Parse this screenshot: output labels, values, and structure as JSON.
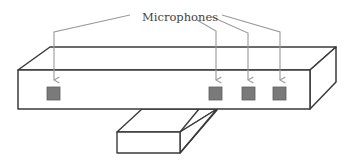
{
  "diagram": {
    "title_label": "Microphones",
    "colors": {
      "outline": "#3a3a3a",
      "leader": "#9a9a9a",
      "microphone_fill": "#7a7a7a",
      "microphone_stroke": "#5e5e5e",
      "background": "#ffffff"
    },
    "components": [
      {
        "name": "sensor-bar",
        "description": "Long rectangular box (3D bar)"
      },
      {
        "name": "stand",
        "description": "Short rectangular base below bar"
      }
    ],
    "microphones": [
      {
        "id": 1,
        "x": 47,
        "y": 87
      },
      {
        "id": 2,
        "x": 209,
        "y": 87
      },
      {
        "id": 3,
        "x": 242,
        "y": 87
      },
      {
        "id": 4,
        "x": 273,
        "y": 87
      }
    ],
    "microphone_count": 4
  }
}
